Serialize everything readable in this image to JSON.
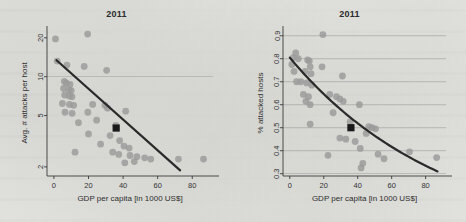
{
  "figure": {
    "background_color": "#e8e8e6",
    "point_color": "#9a9a9a",
    "trend_color": "#2a2a2a",
    "highlight_color": "#1a1a1a",
    "grid_color": "#8f8f8f"
  },
  "chart_data": [
    {
      "type": "scatter",
      "panel": "left",
      "title": "2011",
      "xlabel": "GDP per capita [in 1000 US$]",
      "ylabel": "Avg. # attacks per host",
      "xlim": [
        -4,
        92
      ],
      "ylim": [
        1.7,
        23
      ],
      "yscale": "log",
      "xticks": [
        0,
        20,
        40,
        60,
        80
      ],
      "xticklabels": [
        "0",
        "20",
        "40",
        "60",
        "80"
      ],
      "yticks": [
        2,
        5,
        10,
        20
      ],
      "yticklabels": [
        "2",
        "5",
        "10",
        "20"
      ],
      "grid": "horizontal-single-at-10",
      "gridlines_y": [
        10
      ],
      "legend": "none",
      "points": [
        [
          0.9,
          19.6
        ],
        [
          19.5,
          21.4
        ],
        [
          1.9,
          13.2
        ],
        [
          7.5,
          12.3
        ],
        [
          17.5,
          12.0
        ],
        [
          30.5,
          11.2
        ],
        [
          6.0,
          9.2
        ],
        [
          7.2,
          8.9
        ],
        [
          9.3,
          8.7
        ],
        [
          5.6,
          8.1
        ],
        [
          8.6,
          7.9
        ],
        [
          10.0,
          7.8
        ],
        [
          6.2,
          7.2
        ],
        [
          8.9,
          7.1
        ],
        [
          10.4,
          7.0
        ],
        [
          4.9,
          6.2
        ],
        [
          9.0,
          6.1
        ],
        [
          11.4,
          6.0
        ],
        [
          22.4,
          6.1
        ],
        [
          29.5,
          6.0
        ],
        [
          31.0,
          5.7
        ],
        [
          6.4,
          5.3
        ],
        [
          10.5,
          5.2
        ],
        [
          19.6,
          5.3
        ],
        [
          41.5,
          5.4
        ],
        [
          24.7,
          4.6
        ],
        [
          14.2,
          4.4
        ],
        [
          35.8,
          4.2
        ],
        [
          20.0,
          3.6
        ],
        [
          32.5,
          3.5
        ],
        [
          38.0,
          3.2
        ],
        [
          27.0,
          3.0
        ],
        [
          40.5,
          2.9
        ],
        [
          43.5,
          2.8
        ],
        [
          34.0,
          2.6
        ],
        [
          37.5,
          2.5
        ],
        [
          44.0,
          2.45
        ],
        [
          48.0,
          2.4
        ],
        [
          52.5,
          2.35
        ],
        [
          72.0,
          2.3
        ],
        [
          86.5,
          2.3
        ],
        [
          41.0,
          2.15
        ],
        [
          46.5,
          2.2
        ],
        [
          56.0,
          2.3
        ],
        [
          12.2,
          2.6
        ]
      ],
      "highlight_point": [
        36.0,
        4.0
      ],
      "trend": {
        "type": "linear-log",
        "x0": 1.5,
        "y0": 13.4,
        "x1": 73.0,
        "y1": 1.88
      }
    },
    {
      "type": "scatter",
      "panel": "right",
      "title": "2011",
      "xlabel": "GDP per capita [in 1000 US$]",
      "ylabel": "% attacked hosts",
      "xlim": [
        -4,
        92
      ],
      "ylim": [
        0.29,
        0.925
      ],
      "yscale": "linear",
      "xticks": [
        0,
        20,
        40,
        60,
        80
      ],
      "xticklabels": [
        "0",
        "20",
        "40",
        "60",
        "80"
      ],
      "yticks": [
        0.3,
        0.4,
        0.5,
        0.6,
        0.7,
        0.8,
        0.9
      ],
      "yticklabels": [
        "0.3",
        "0.4",
        "0.5",
        "0.6",
        "0.7",
        "0.8",
        "0.9"
      ],
      "grid": "horizontal",
      "gridlines_y": [
        0.3,
        0.4,
        0.5,
        0.6,
        0.7,
        0.8,
        0.9
      ],
      "legend": "none",
      "points": [
        [
          19.5,
          0.905
        ],
        [
          3.5,
          0.825
        ],
        [
          2.0,
          0.805
        ],
        [
          5.0,
          0.8
        ],
        [
          10.5,
          0.795
        ],
        [
          11.5,
          0.79
        ],
        [
          1.2,
          0.775
        ],
        [
          12.0,
          0.765
        ],
        [
          19.0,
          0.765
        ],
        [
          2.5,
          0.745
        ],
        [
          9.0,
          0.745
        ],
        [
          12.5,
          0.735
        ],
        [
          31.0,
          0.725
        ],
        [
          4.0,
          0.7
        ],
        [
          6.5,
          0.7
        ],
        [
          10.0,
          0.695
        ],
        [
          13.0,
          0.685
        ],
        [
          8.0,
          0.645
        ],
        [
          11.0,
          0.635
        ],
        [
          23.5,
          0.645
        ],
        [
          27.5,
          0.635
        ],
        [
          29.5,
          0.625
        ],
        [
          31.5,
          0.615
        ],
        [
          9.5,
          0.615
        ],
        [
          12.0,
          0.6
        ],
        [
          41.0,
          0.6
        ],
        [
          25.5,
          0.565
        ],
        [
          35.5,
          0.525
        ],
        [
          12.0,
          0.515
        ],
        [
          46.5,
          0.505
        ],
        [
          48.5,
          0.5
        ],
        [
          50.5,
          0.495
        ],
        [
          45.0,
          0.475
        ],
        [
          29.5,
          0.455
        ],
        [
          33.0,
          0.45
        ],
        [
          38.5,
          0.44
        ],
        [
          41.5,
          0.41
        ],
        [
          52.0,
          0.385
        ],
        [
          70.5,
          0.395
        ],
        [
          55.5,
          0.365
        ],
        [
          86.5,
          0.37
        ],
        [
          43.0,
          0.345
        ],
        [
          42.0,
          0.325
        ],
        [
          22.5,
          0.38
        ]
      ],
      "highlight_point": [
        36.0,
        0.5
      ],
      "trend": {
        "type": "exponential-decay",
        "x0": 0.0,
        "y0": 0.805,
        "x1": 87.0,
        "y1": 0.31
      }
    }
  ]
}
